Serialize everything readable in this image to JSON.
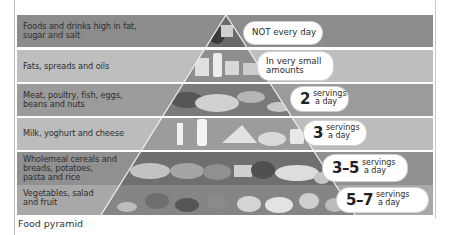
{
  "figure": {
    "title": "Food pyramid",
    "caption": "Food pyramid",
    "bands": [
      {
        "label_lines": [
          "Foods and drinks high in fat,",
          "sugar and salt"
        ],
        "recommendation": {
          "text": "NOT every day"
        },
        "color": "#8a8a8a"
      },
      {
        "label_lines": [
          "Fats, spreads and oils"
        ],
        "recommendation": {
          "text_lines": [
            "In very small",
            "amounts"
          ]
        },
        "color": "#bdbdbd"
      },
      {
        "label_lines": [
          "Meat, poultry, fish, eggs,",
          "beans and nuts"
        ],
        "recommendation": {
          "number": "2",
          "unit_lines": [
            "servings",
            "a day"
          ]
        },
        "color": "#9a9a9a"
      },
      {
        "label_lines": [
          "Milk, yoghurt and cheese"
        ],
        "recommendation": {
          "number": "3",
          "unit_lines": [
            "servings",
            "a day"
          ]
        },
        "color": "#bababa"
      },
      {
        "label_lines": [
          "Wholemeal cereals and",
          "breads, potatoes,",
          "pasta and rice"
        ],
        "recommendation": {
          "number": "3–5",
          "unit_lines": [
            "servings",
            "a day"
          ]
        },
        "color": "#8f8f8f"
      },
      {
        "label_lines": [
          "Vegetables, salad",
          "and fruit"
        ],
        "recommendation": {
          "number": "5–7",
          "unit_lines": [
            "servings",
            "a day"
          ]
        },
        "color": "#a6a6a6"
      }
    ],
    "pyramid_fill": "#6e6e6e"
  }
}
